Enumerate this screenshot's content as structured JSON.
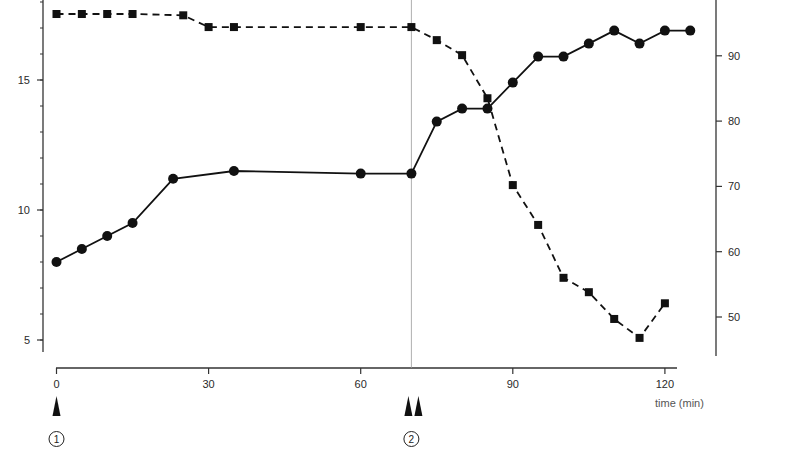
{
  "chart_data": {
    "type": "line",
    "title": "",
    "xlabel": "time (min)",
    "ylabel_left": "",
    "ylabel_right": "",
    "x_ticks": [
      0,
      30,
      60,
      90,
      120
    ],
    "x_range": [
      0,
      125
    ],
    "y_left_ticks": [
      5,
      10,
      15
    ],
    "y_left_range": [
      4.2,
      18.1
    ],
    "y_right_ticks": [
      50,
      60,
      70,
      80,
      90
    ],
    "y_right_range": [
      44.3,
      98.5
    ],
    "grid": false,
    "legend": null,
    "series": [
      {
        "name": "circles (solid line)",
        "axis": "left",
        "marker": "circle",
        "line_style": "solid",
        "x": [
          0,
          5,
          10,
          15,
          23,
          35,
          60,
          70,
          75,
          80,
          85,
          90,
          95,
          100,
          105,
          110,
          115,
          120,
          125
        ],
        "values": [
          8.0,
          8.5,
          9.0,
          9.5,
          11.2,
          11.5,
          11.4,
          11.4,
          13.4,
          13.9,
          13.9,
          14.9,
          15.9,
          15.9,
          16.4,
          16.9,
          16.4,
          16.9,
          16.9
        ]
      },
      {
        "name": "squares (dashed line)",
        "axis": "right",
        "marker": "square",
        "line_style": "dashed",
        "x": [
          0,
          5,
          10,
          15,
          25,
          30,
          35,
          60,
          70,
          75,
          80,
          85,
          90,
          95,
          100,
          105,
          110,
          115,
          120
        ],
        "values": [
          96.4,
          96.4,
          96.4,
          96.4,
          96.2,
          94.4,
          94.4,
          94.4,
          94.4,
          92.4,
          90.1,
          83.5,
          70.2,
          64.1,
          56.0,
          53.8,
          49.7,
          46.8,
          52.1
        ]
      }
    ],
    "annotations": [
      {
        "type": "vertical_line",
        "x": 70
      },
      {
        "type": "arrow_marker",
        "x": 0,
        "count": 1,
        "label": "1"
      },
      {
        "type": "arrow_marker",
        "x": 70,
        "count": 2,
        "label": "2"
      }
    ]
  },
  "labels": {
    "x_title": "time (min)",
    "event_1": "1",
    "event_2": "2"
  }
}
